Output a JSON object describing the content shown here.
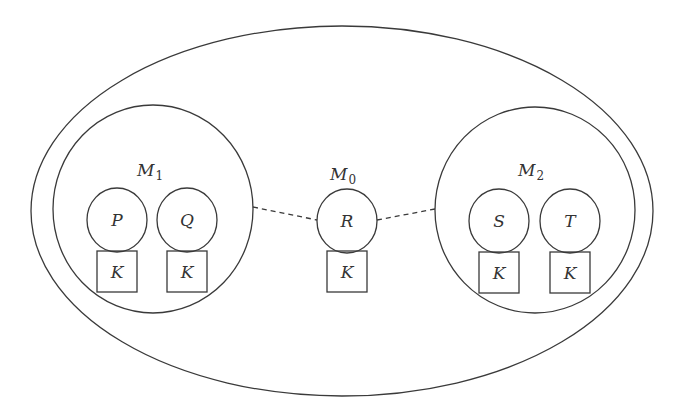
{
  "diagram": {
    "outer_boundary": {
      "shape": "ellipse"
    },
    "groups": [
      {
        "id": "M1",
        "label": "M",
        "subscript": "1",
        "nodes": [
          {
            "label": "P",
            "key_label": "K"
          },
          {
            "label": "Q",
            "key_label": "K"
          }
        ]
      },
      {
        "id": "M0",
        "label": "M",
        "subscript": "0",
        "nodes": [
          {
            "label": "R",
            "key_label": "K"
          }
        ]
      },
      {
        "id": "M2",
        "label": "M",
        "subscript": "2",
        "nodes": [
          {
            "label": "S",
            "key_label": "K"
          },
          {
            "label": "T",
            "key_label": "K"
          }
        ]
      }
    ],
    "connections": [
      {
        "from": "M1",
        "to": "R",
        "style": "dashed"
      },
      {
        "from": "R",
        "to": "M2",
        "style": "dashed"
      }
    ],
    "colors": {
      "stroke": "#3a3a3a",
      "text": "#333333",
      "background": "#ffffff"
    }
  }
}
